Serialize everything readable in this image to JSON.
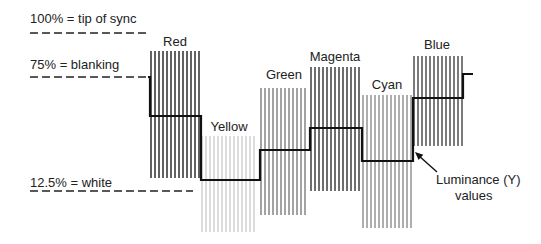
{
  "reference_levels": [
    {
      "label": "100% = tip of sync",
      "y": 33,
      "text_y": 12,
      "dash_x0": 30,
      "dash_x1": 150
    },
    {
      "label": "75% = blanking",
      "y": 77,
      "text_y": 58,
      "dash_x0": 30,
      "dash_x1": 148
    },
    {
      "label": "12.5% = white",
      "y": 191,
      "text_y": 176,
      "dash_x0": 30,
      "dash_x1": 193
    }
  ],
  "bars": [
    {
      "name": "Red",
      "x0": 150,
      "x1": 200,
      "top": 51,
      "bottom": 178,
      "luma_y": 116,
      "stripe": "#3a3a3a",
      "label_x": 175,
      "label_y": 35
    },
    {
      "name": "Yellow",
      "x0": 201,
      "x1": 257,
      "top": 136,
      "bottom": 232,
      "luma_y": 180,
      "stripe": "#d4d4d4",
      "label_x": 229,
      "label_y": 120
    },
    {
      "name": "Green",
      "x0": 260,
      "x1": 308,
      "top": 88,
      "bottom": 215,
      "luma_y": 150,
      "stripe": "#8c8c8c",
      "label_x": 284,
      "label_y": 68
    },
    {
      "name": "Magenta",
      "x0": 310,
      "x1": 360,
      "top": 67,
      "bottom": 191,
      "luma_y": 128,
      "stripe": "#4a4a4a",
      "label_x": 335,
      "label_y": 50
    },
    {
      "name": "Cyan",
      "x0": 362,
      "x1": 413,
      "top": 95,
      "bottom": 228,
      "luma_y": 161,
      "stripe": "#9a9a9a",
      "label_x": 387,
      "label_y": 78
    },
    {
      "name": "Blue",
      "x0": 413,
      "x1": 463,
      "top": 56,
      "bottom": 146,
      "luma_y": 98,
      "stripe": "#5a5a5a",
      "label_x": 437,
      "label_y": 38
    }
  ],
  "luminance_trace": {
    "start": {
      "x": 30,
      "y": 77
    },
    "blanking_end_x": 150,
    "tail": {
      "x0": 463,
      "x1": 473,
      "y": 74
    },
    "color": "#111111"
  },
  "annotation": {
    "line1": "Luminance (Y)",
    "line2": "values",
    "line1_x": 436,
    "line1_y": 173,
    "line2_x": 455,
    "line2_y": 189,
    "arrow_from": {
      "x": 437,
      "y": 172
    },
    "arrow_to": {
      "x": 415,
      "y": 152
    }
  },
  "stripe_pitch": 4,
  "stripe_width": 1.6
}
